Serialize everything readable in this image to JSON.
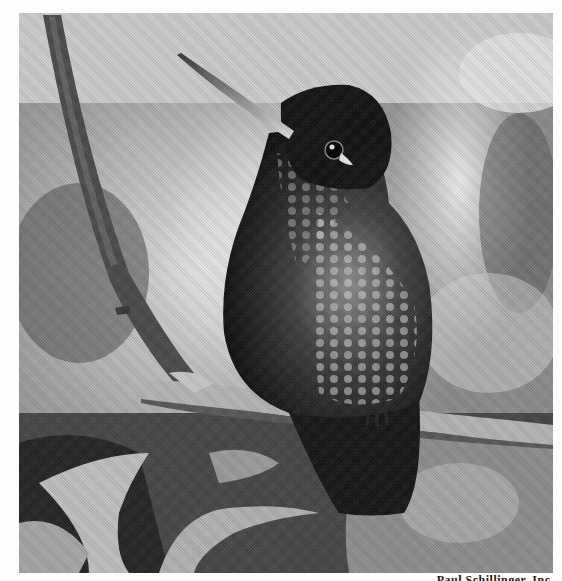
{
  "image": {
    "subject": "Hummingbird perched on a branch",
    "style": "black-and-white halftone photograph",
    "tones": {
      "background_light": "#d8d8d8",
      "background_mid": "#9a9a9a",
      "background_dark": "#3a3a3a",
      "bird_dark": "#1e1e1e",
      "bird_highlight": "#c8c8c8",
      "branch": "#a8a8a8",
      "branch_dark": "#4a4a4a",
      "paper": "#fdfdfd"
    }
  },
  "caption": {
    "credit": "Paul Schillinger, Inc."
  }
}
